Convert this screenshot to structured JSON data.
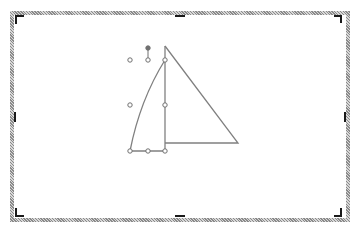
{
  "canvas": {
    "description": "slide/drawing canvas with selected sailboat shape",
    "colors": {
      "frame_hatch": "#8a8a8a",
      "shape_stroke": "#808080",
      "handle_stroke": "#707070",
      "crop_marks": "#1a1a1a",
      "background": "#ffffff"
    },
    "selection": {
      "handles": [
        "top-left",
        "top-center",
        "top-right",
        "middle-left",
        "middle-right",
        "bottom-left",
        "bottom-center",
        "bottom-right"
      ],
      "rotation_handle": true
    },
    "shapes": [
      {
        "name": "left-sail",
        "type": "curved-triangle"
      },
      {
        "name": "right-sail",
        "type": "right-triangle"
      },
      {
        "name": "mast",
        "type": "line"
      }
    ]
  }
}
